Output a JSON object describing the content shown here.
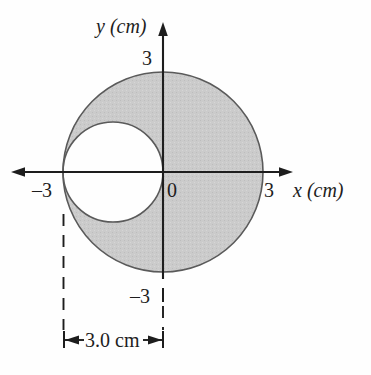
{
  "figure": {
    "axes": {
      "y_axis_name": "y (cm)",
      "x_axis_name": "x (cm)",
      "origin_label": "0",
      "y_tick_positive": "3",
      "y_tick_negative": "–3",
      "x_tick_positive": "3",
      "x_tick_negative": "–3"
    },
    "dimension": {
      "label": "3.0 cm"
    },
    "colors": {
      "shaded_fill": "#c9c9c9",
      "outline": "#5a5a5a",
      "axis": "#1d1d1d",
      "text": "#1d1d1d",
      "background": "#fefefe"
    }
  },
  "chart_data": {
    "type": "scatter",
    "title": "",
    "subtitle": "",
    "xlabel": "x (cm)",
    "ylabel": "y (cm)",
    "xlim": [
      -3.6,
      3.6
    ],
    "ylim": [
      -3.6,
      3.6
    ],
    "grid": false,
    "legend": null,
    "xticks": [
      -3,
      0,
      3
    ],
    "xticklabels": [
      "–3",
      "0",
      "3"
    ],
    "yticks": [
      -3,
      0,
      3
    ],
    "yticklabels": [
      "–3",
      "0",
      "3"
    ],
    "shapes": [
      {
        "name": "large-shaded-disk",
        "type": "circle",
        "center": [
          0,
          0
        ],
        "radius": 3,
        "fill": "#c9c9c9",
        "stroke": "#5a5a5a",
        "note": "shaded disk of radius 3 cm centered on the origin"
      },
      {
        "name": "circular-hole",
        "type": "circle",
        "center": [
          -1.5,
          0
        ],
        "radius": 1.5,
        "fill": "#ffffff",
        "stroke": "#5a5a5a",
        "note": "unshaded circular hole, internally tangent at x = -3 cm and passing through the origin"
      }
    ],
    "annotations": [
      {
        "name": "hole-diameter-dimension",
        "text": "3.0 cm",
        "type": "dimension",
        "from_x": -3.0,
        "to_x": 0.0,
        "y": -4.9,
        "note": "double-headed dimension arrow spanning the hole diameter, with dashed extension lines"
      }
    ]
  }
}
